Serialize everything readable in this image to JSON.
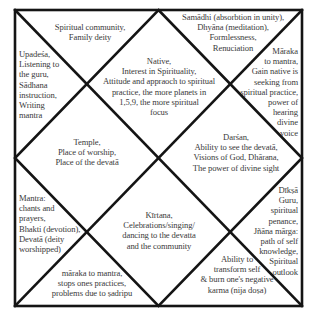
{
  "chart": {
    "style": "North Indian birth chart",
    "frame": {
      "left": 15,
      "top": 10,
      "right": 302,
      "bottom": 306
    },
    "line_color": "#141414",
    "text_color": "#3a3a3a",
    "background": "#ffffff"
  },
  "houses": [
    {
      "id": 1,
      "position": "top-center diamond",
      "lines": [
        "Native,",
        "Interest in Spirituality,",
        "Attitude and appraoch to spiritual",
        "practice, the more planets in",
        "1,5,9, the more spiritual",
        "focus"
      ]
    },
    {
      "id": 2,
      "position": "top-left triangle",
      "lines": [
        "Spiritual community,",
        "Family deity"
      ]
    },
    {
      "id": 3,
      "position": "left-upper triangle",
      "lines": [
        "Upadeśa,",
        "Listening to",
        "the guru,",
        "Sādhana",
        "instruction,",
        "Writing",
        "mantra"
      ]
    },
    {
      "id": 4,
      "position": "left-center diamond",
      "lines": [
        "Temple,",
        "Place of worship,",
        "Place of the devatā"
      ]
    },
    {
      "id": 5,
      "position": "left-lower triangle",
      "lines": [
        "Mantra:",
        "chants and",
        "prayers,",
        "Bhakti (devotion),",
        "Devatā (deity",
        "worshipped)"
      ]
    },
    {
      "id": 6,
      "position": "bottom-left triangle",
      "lines": [
        "māraka to mantra,",
        "stops ones practices,",
        "problems due to ṣadripu"
      ]
    },
    {
      "id": 7,
      "position": "bottom-center diamond",
      "lines": [
        "Kīrtana,",
        "Celebrations/singing/",
        "dancing to the devatta",
        "and the community"
      ]
    },
    {
      "id": 8,
      "position": "bottom-right triangle",
      "lines": [
        "Ability to",
        "transform self",
        "& burn one's negative",
        "karma (nija doṣa)"
      ]
    },
    {
      "id": 9,
      "position": "right-lower triangle",
      "lines": [
        "Dīkṣā",
        "Guru,",
        "spiritual",
        "penance,",
        "Jñāna mārga:",
        "path of self",
        "knowledge,",
        "Spiritual",
        "outlook"
      ]
    },
    {
      "id": 10,
      "position": "right-center diamond",
      "lines": [
        "Darśan,",
        "Ability to see the devatā,",
        "Visions of God, Dhārana,",
        "The power of divine sight"
      ]
    },
    {
      "id": 11,
      "position": "right-upper triangle",
      "lines": [
        "Māraka",
        "to mantra,",
        "Gain native is",
        "seeking from",
        "spiritual practice,",
        "power of",
        "hearing",
        "divine",
        "voice"
      ]
    },
    {
      "id": 12,
      "position": "top-right triangle",
      "lines": [
        "Samādhi (absorbtion in unity),",
        "Dhyāna (meditation),",
        "Formlessness,",
        "Renuciation"
      ]
    }
  ]
}
